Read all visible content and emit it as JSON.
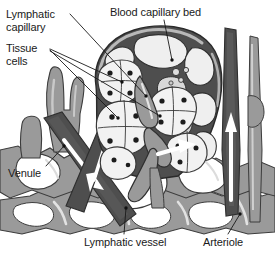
{
  "figure": {
    "width": 275,
    "height": 260,
    "style": "grayscale anatomical line illustration"
  },
  "labels": {
    "lymphatic_capillary": "Lymphatic\ncapillary",
    "tissue_cells": "Tissue\ncells",
    "blood_capillary_bed": "Blood capillary bed",
    "venule": "Venule",
    "lymphatic_vessel": "Lymphatic vessel",
    "arteriole": "Arteriole"
  },
  "colors": {
    "background": "#ffffff",
    "text": "#1a1a1a",
    "leader_line": "#1a1a1a",
    "vessel_dark": "#4e4e4e",
    "vessel_dark_shade": "#3a3a3a",
    "vessel_mid": "#9a9a9a",
    "vessel_mid_shade": "#858585",
    "vessel_light": "#c4c4c4",
    "cell_fill": "#f2f2f2",
    "cell_outline": "#4a4a4a",
    "nucleus": "#1c1c1c",
    "flow_arrow": "#ffffff",
    "outline": "#3c3c3c"
  },
  "structures": [
    {
      "name": "blood-capillary-bed",
      "tone": "vessel_dark",
      "description": "dark anastomosing capillary mesh forming a dome over the tissue region"
    },
    {
      "name": "lymphatic-capillary",
      "tone": "vessel_mid",
      "description": "blind-ended medium-gray lymphatic capillary entering the tissue space"
    },
    {
      "name": "tissue-cells",
      "tone": "cell_fill",
      "description": "clusters of pale polygonal cells each containing a dark nucleus"
    },
    {
      "name": "venule",
      "tone": "vessel_dark",
      "description": "dark vessel running diagonally at lower left with white flow arrows"
    },
    {
      "name": "arteriole",
      "tone": "vessel_dark",
      "description": "dark vertical vessel at right with a white upward flow arrow"
    },
    {
      "name": "lymphatic-vessel",
      "tone": "vessel_mid",
      "description": "medium-gray branching lymphatic vessel network in the lower field"
    }
  ],
  "flow_arrows": [
    {
      "name": "venule-flow-arrow",
      "direction": "down-right"
    },
    {
      "name": "arteriole-flow-arrow",
      "direction": "up"
    },
    {
      "name": "lymph-flow-arrow",
      "direction": "right"
    }
  ]
}
